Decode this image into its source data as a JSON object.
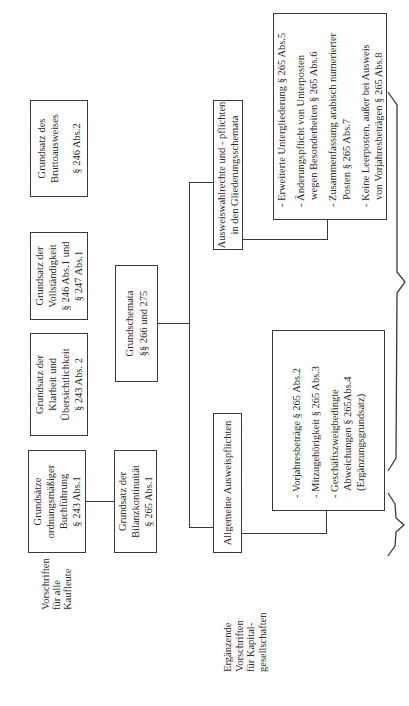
{
  "row1": {
    "gob": [
      "Grundsätze",
      "ordnungsmäßiger",
      "Buchführung",
      "§ 243 Abs.1"
    ],
    "klarheit": [
      "Grundsatz der",
      "Klarheit und",
      "Übersichtlichkeit",
      "§ 243 Abs. 2"
    ],
    "vollstaendigkeit": [
      "Grundsatz der",
      "Vollständigkeit",
      "§ 246 Abs.1 und",
      "§ 247 Abs.1"
    ],
    "brutto": [
      "Grundsatz des",
      "Bruttoausweises",
      "§ 246 Abs.2"
    ]
  },
  "row2": {
    "bilanzkontinuitaet": [
      "Grundsatz der",
      "Bilanzkontinuität",
      "§ 265 Abs.1"
    ],
    "grundschemata": [
      "Grundschemata",
      "§§ 266 und 275"
    ]
  },
  "row3": {
    "allgemeine": "Allgemeine Ausweispflichten",
    "ausweiswahlrechte": [
      "Ausweiswahlrechte und - pflichten",
      "in den Gliederungsschemata"
    ]
  },
  "row4": {
    "left_list": [
      {
        "lines": [
          "- Vorjahresbeträge § 265 Abs.2"
        ]
      },
      {
        "lines": [
          "- Mitzugehörigkeit § 265 Abs.3"
        ]
      },
      {
        "lines": [
          "- Geschäftszweigbedingte",
          "Abweichungen § 265Abs.4",
          "(Ergänzungsgrundsatz)"
        ]
      }
    ],
    "right_list": [
      {
        "lines": [
          "- Erweiterte Untergliederung § 265 Abs.5"
        ]
      },
      {
        "lines": [
          "- Änderungspflicht von Unterposten",
          "wegen Besonderheiten § 265 Abs.6"
        ]
      },
      {
        "lines": [
          "- Zusammenfassung arabisch numerierter",
          "Posten § 265 Abs.7"
        ]
      },
      {
        "lines": [
          "- Keine Leerposten, außer bei Ausweis",
          "von Vorjahresbeträgen § 265 Abs.8"
        ]
      }
    ]
  },
  "labels": {
    "alle_kaufleute": [
      "Vorschriften",
      "für alle",
      "Kaufleute"
    ],
    "kapitalgesellschaften": [
      "Ergänzende",
      "Vorschriften",
      "für Kapital-",
      "gesellschaften"
    ]
  }
}
